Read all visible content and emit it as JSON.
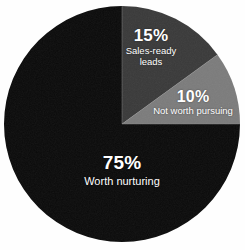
{
  "chart_data": {
    "type": "pie",
    "title": "",
    "subtitle": "",
    "xlabel": "",
    "ylabel": "",
    "legend_position": "none",
    "grid": false,
    "labels_inside": true,
    "start_angle_deg": 0,
    "direction": "clockwise",
    "categories": [
      "Sales-ready leads",
      "Not worth pursuing",
      "Worth nurturing"
    ],
    "values": [
      15,
      10,
      75
    ],
    "units": "percent",
    "colors": [
      "#3a3a3a",
      "#7c7c7c",
      "#0b0b0b"
    ],
    "slices": [
      {
        "name": "Sales-ready leads",
        "percent_label": "15%",
        "value": 15,
        "color": "#3a3a3a",
        "label_line_1": "Sales-ready",
        "label_line_2": "leads",
        "start_angle_deg": 0,
        "end_angle_deg": 54
      },
      {
        "name": "Not worth pursuing",
        "percent_label": "10%",
        "value": 10,
        "color": "#7c7c7c",
        "label_line_1": "Not worth pursuing",
        "label_line_2": "",
        "start_angle_deg": 54,
        "end_angle_deg": 90
      },
      {
        "name": "Worth nurturing",
        "percent_label": "75%",
        "value": 75,
        "color": "#0b0b0b",
        "label_line_1": "Worth nurturing",
        "label_line_2": "",
        "start_angle_deg": 90,
        "end_angle_deg": 360
      }
    ]
  },
  "canvas": {
    "background": "#fefefe",
    "label_color": "#ffffff",
    "center_x": 122,
    "center_y": 124,
    "radius": 118
  }
}
